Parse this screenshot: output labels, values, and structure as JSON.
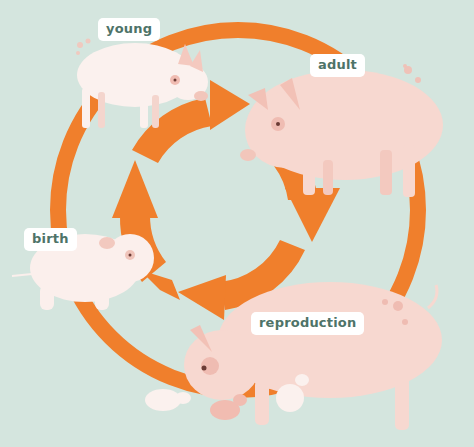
{
  "diagram": {
    "type": "life-cycle",
    "colors": {
      "background": "#d4e5de",
      "arrow": "#f07f2c",
      "label_bg": "#ffffff",
      "label_text": "#4e7368",
      "pig_pink": "#f6d3cb",
      "piglet_white": "#fbf1ee",
      "pig_spot": "#eebcb2"
    },
    "stages": [
      {
        "id": "young",
        "label": "young"
      },
      {
        "id": "adult",
        "label": "adult"
      },
      {
        "id": "reproduction",
        "label": "reproduction"
      },
      {
        "id": "birth",
        "label": "birth"
      }
    ],
    "flow": [
      "birth",
      "young",
      "adult",
      "reproduction",
      "birth"
    ],
    "illustrations": {
      "young": "young piglet standing",
      "adult": "adult pig standing",
      "reproduction": "sow with three piglets",
      "birth": "newborn piglet"
    }
  }
}
